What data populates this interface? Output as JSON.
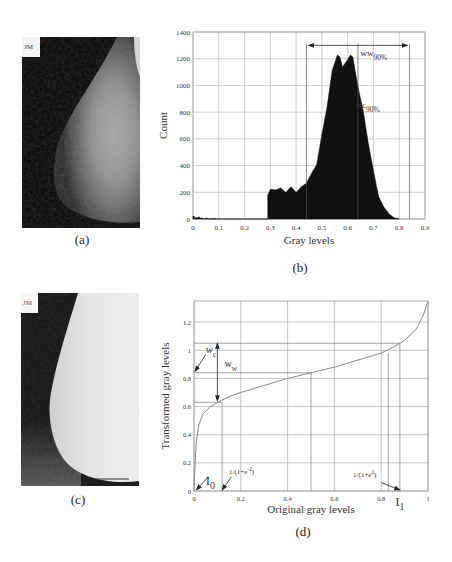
{
  "figure": {
    "panels": {
      "a": {
        "caption": "(a)",
        "label_text": "JM",
        "description": "original mammogram (dark)"
      },
      "b": {
        "caption": "(b)"
      },
      "c": {
        "caption": "(c)",
        "label_text": "JM",
        "description": "enhanced mammogram (bright)"
      },
      "d": {
        "caption": "(d)"
      }
    }
  },
  "chart_data": [
    {
      "panel": "b",
      "type": "bar",
      "title": "",
      "xlabel": "Gray levels",
      "ylabel": "Count",
      "xlim": [
        0,
        0.9
      ],
      "ylim": [
        0,
        1400
      ],
      "xticks": [
        "0",
        "0.1",
        "0.2",
        "0.3",
        "0.4",
        "0.5",
        "0.6",
        "0.7",
        "0.8",
        "0.9"
      ],
      "yticks": [
        "0",
        "200",
        "400",
        "600",
        "800",
        "1000",
        "1200",
        "1400"
      ],
      "grid": true,
      "x": [
        0.0,
        0.01,
        0.02,
        0.03,
        0.05,
        0.08,
        0.29,
        0.3,
        0.32,
        0.34,
        0.36,
        0.38,
        0.4,
        0.42,
        0.44,
        0.46,
        0.48,
        0.5,
        0.52,
        0.54,
        0.56,
        0.57,
        0.58,
        0.6,
        0.61,
        0.62,
        0.64,
        0.66,
        0.68,
        0.7,
        0.72,
        0.74,
        0.76,
        0.78,
        0.8
      ],
      "values": [
        20,
        10,
        15,
        8,
        5,
        3,
        190,
        210,
        230,
        220,
        210,
        230,
        210,
        230,
        280,
        330,
        420,
        620,
        850,
        1100,
        1240,
        1200,
        1150,
        1180,
        1240,
        1200,
        1000,
        800,
        580,
        350,
        180,
        90,
        40,
        10,
        0
      ],
      "annotations": [
        {
          "text": "ww",
          "subscript": "90%",
          "x": 0.65,
          "y": 1220
        },
        {
          "text": "wc",
          "subscript": "90%",
          "x": 0.63,
          "y": 830
        }
      ],
      "window_arrow": {
        "from": 0.44,
        "to": 0.84,
        "y": 1300
      },
      "vertical_lines": [
        0.44,
        0.64,
        0.84
      ]
    },
    {
      "panel": "d",
      "type": "line",
      "title": "",
      "xlabel": "Original gray levels",
      "ylabel": "Transformed gray levels",
      "xlim": [
        0,
        1
      ],
      "ylim": [
        0,
        1.35
      ],
      "xticks": [
        "0",
        "0.2",
        "0.4",
        "0.6",
        "0.8",
        "1"
      ],
      "yticks": [
        "0",
        "0.2",
        "0.4",
        "0.6",
        "0.8",
        "1",
        "1.2"
      ],
      "grid": true,
      "series": [
        {
          "name": "sigmoid transform",
          "x": [
            0.0,
            0.005,
            0.01,
            0.02,
            0.04,
            0.07,
            0.1,
            0.15,
            0.2,
            0.3,
            0.4,
            0.5,
            0.6,
            0.7,
            0.8,
            0.85,
            0.9,
            0.95,
            0.98,
            1.0
          ],
          "values": [
            0.0,
            0.2,
            0.35,
            0.47,
            0.55,
            0.6,
            0.63,
            0.67,
            0.7,
            0.75,
            0.8,
            0.84,
            0.88,
            0.93,
            0.98,
            1.02,
            1.07,
            1.15,
            1.25,
            1.35
          ]
        }
      ],
      "annotations": [
        {
          "text": "I",
          "subscript": "0",
          "x": 0.0,
          "y": 0.0
        },
        {
          "text": "1/(1+e",
          "superscript": "-2",
          "suffix": ")",
          "x": 0.12,
          "y": 0.0
        },
        {
          "text": "1/(1+e",
          "superscript": "2",
          "suffix": ")",
          "x": 0.88,
          "y": 0.0
        },
        {
          "text": "I",
          "subscript": "1",
          "x": 0.88,
          "y": -0.05
        },
        {
          "text": "w",
          "subscript": "c",
          "x": 0.02,
          "y": 0.97
        },
        {
          "text": "w",
          "subscript": "w",
          "x": 0.13,
          "y": 0.92
        }
      ],
      "reference_lines": {
        "vertical": [
          0.12,
          0.5,
          0.83,
          0.88
        ],
        "horizontal": [
          0.63,
          0.84,
          1.05
        ]
      }
    }
  ]
}
